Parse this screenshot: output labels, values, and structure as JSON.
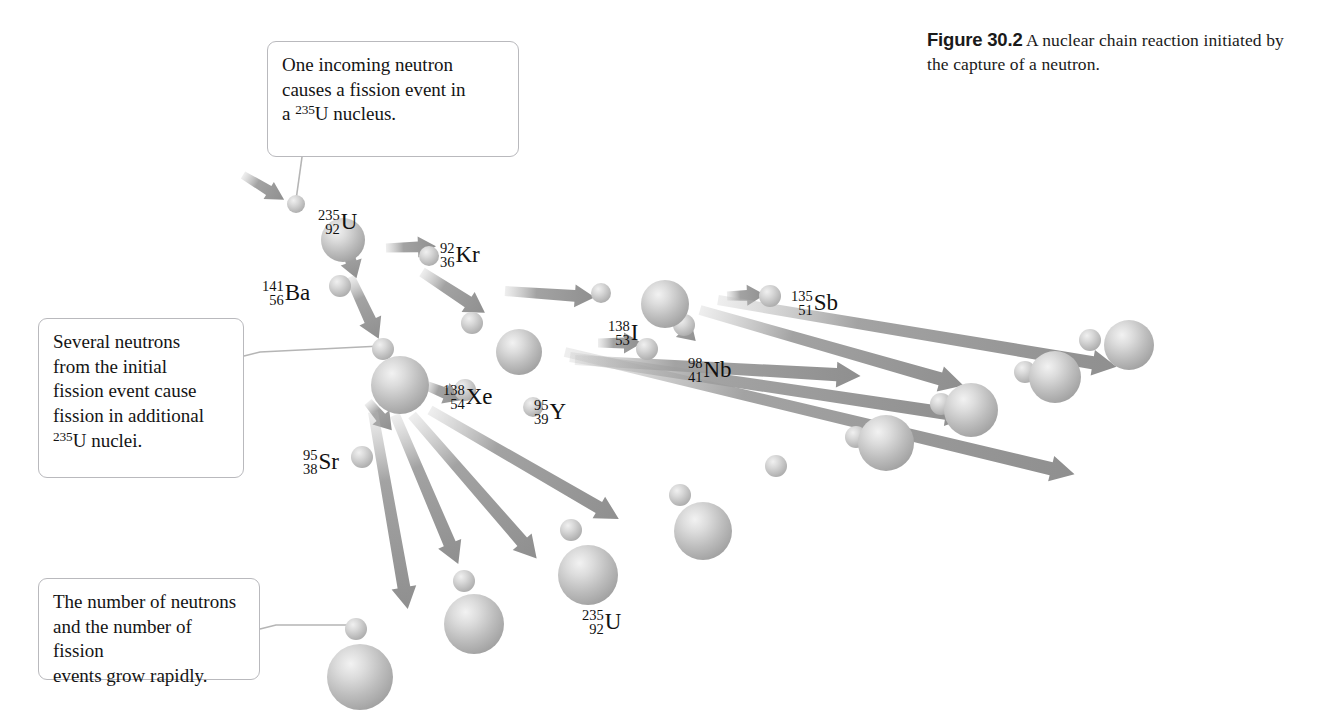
{
  "figure": {
    "label": "Figure 30.2",
    "caption": "A nuclear chain reaction initiated by the capture of a neutron."
  },
  "callouts": [
    {
      "id": "callout-1",
      "lines": [
        "One incoming neutron",
        "causes a fission event in",
        "a "
      ],
      "iso_mass": "235",
      "iso_symbol": "U",
      "tail": " nucleus."
    },
    {
      "id": "callout-2",
      "lines": [
        "Several neutrons",
        "from the initial",
        "fission event cause",
        "fission in additional",
        ""
      ],
      "iso_mass": "235",
      "iso_symbol": "U",
      "tail": " nuclei."
    },
    {
      "id": "callout-3",
      "lines": [
        "The number of neutrons",
        "and the number of fission",
        "events grow rapidly."
      ],
      "iso_mass": "",
      "iso_symbol": "",
      "tail": ""
    }
  ],
  "nuclides": [
    {
      "name": "u235-initial",
      "mass": "235",
      "atomic": "92",
      "symbol": "U",
      "x": 318,
      "y": 207
    },
    {
      "name": "kr92",
      "mass": "92",
      "atomic": "36",
      "symbol": "Kr",
      "x": 440,
      "y": 240
    },
    {
      "name": "ba141",
      "mass": "141",
      "atomic": "56",
      "symbol": "Ba",
      "x": 262,
      "y": 278
    },
    {
      "name": "i138",
      "mass": "138",
      "atomic": "53",
      "symbol": "I",
      "x": 608,
      "y": 318
    },
    {
      "name": "sb135",
      "mass": "135",
      "atomic": "51",
      "symbol": "Sb",
      "x": 791,
      "y": 288
    },
    {
      "name": "nb98",
      "mass": "98",
      "atomic": "41",
      "symbol": "Nb",
      "x": 688,
      "y": 355
    },
    {
      "name": "xe138",
      "mass": "138",
      "atomic": "54",
      "symbol": "Xe",
      "x": 443,
      "y": 382
    },
    {
      "name": "y95",
      "mass": "95",
      "atomic": "39",
      "symbol": "Y",
      "x": 534,
      "y": 397
    },
    {
      "name": "sr95",
      "mass": "95",
      "atomic": "38",
      "symbol": "Sr",
      "x": 303,
      "y": 447
    },
    {
      "name": "u235-lower",
      "mass": "235",
      "atomic": "92",
      "symbol": "U",
      "x": 582,
      "y": 607
    }
  ],
  "colors": {
    "sphere_body": "#b6b6b6",
    "sphere_highlight": "#e8e8e8",
    "arrow": "#9a9a9a",
    "callout_border": "#b9b9bd",
    "leader_line": "#b0b0b0",
    "text": "#141414",
    "background": "#ffffff"
  },
  "diagram": {
    "type": "nuclear-chain-reaction",
    "nucleus_count": 14,
    "neutron_count": 18,
    "arrow_count": 17
  }
}
